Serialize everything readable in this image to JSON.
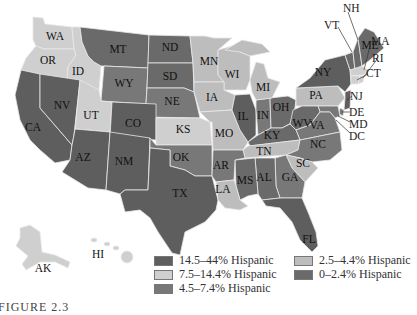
{
  "map": {
    "title": "Hispanic population by state",
    "categories": [
      {
        "id": "c1",
        "label": "14.5–44% Hispanic",
        "color": "#5e5e5e"
      },
      {
        "id": "c2",
        "label": "7.5–14.4% Hispanic",
        "color": "#cfcfcf"
      },
      {
        "id": "c3",
        "label": "4.5–7.4% Hispanic",
        "color": "#787878"
      },
      {
        "id": "c4",
        "label": "2.5–4.4% Hispanic",
        "color": "#bdbdbd"
      },
      {
        "id": "c5",
        "label": "0–2.4% Hispanic",
        "color": "#6a6a6a"
      }
    ],
    "states": {
      "WA": "c2",
      "OR": "c2",
      "ID": "c2",
      "MT": "c5",
      "ND": "c5",
      "SD": "c5",
      "WY": "c3",
      "NE": "c3",
      "MN": "c4",
      "WI": "c4",
      "IA": "c4",
      "MI": "c4",
      "CA": "c1",
      "NV": "c1",
      "UT": "c2",
      "CO": "c1",
      "KS": "c2",
      "MO": "c4",
      "IL": "c1",
      "IN": "c3",
      "OH": "c5",
      "PA": "c4",
      "NY": "c1",
      "ME": "c5",
      "NH": "c5",
      "VT": "c5",
      "MA": "c2",
      "RI": "c2",
      "CT": "c2",
      "NJ": "c1",
      "DE": "c3",
      "MD": "c3",
      "DC": "c2",
      "AZ": "c1",
      "NM": "c1",
      "TX": "c1",
      "OK": "c3",
      "AR": "c3",
      "LA": "c4",
      "KY": "c5",
      "WV": "c5",
      "VA": "c3",
      "TN": "c4",
      "NC": "c3",
      "SC": "c4",
      "MS": "c5",
      "AL": "c5",
      "GA": "c3",
      "FL": "c1",
      "AK": "c2",
      "HI": "c2"
    },
    "labels": [
      "WA",
      "OR",
      "ID",
      "MT",
      "ND",
      "SD",
      "WY",
      "NE",
      "MN",
      "WI",
      "IA",
      "MI",
      "CA",
      "NV",
      "UT",
      "CO",
      "KS",
      "MO",
      "IL",
      "IN",
      "OH",
      "PA",
      "NY",
      "ME",
      "AZ",
      "NM",
      "TX",
      "OK",
      "AR",
      "LA",
      "KY",
      "WV",
      "VA",
      "TN",
      "NC",
      "SC",
      "MS",
      "AL",
      "GA",
      "FL",
      "AK",
      "HI"
    ],
    "callout_labels": [
      "NH",
      "VT",
      "MA",
      "RI",
      "CT",
      "NJ",
      "DE",
      "MD",
      "DC"
    ]
  },
  "legend": {
    "items": [
      {
        "label": "14.5–44% Hispanic"
      },
      {
        "label": "7.5–14.4% Hispanic"
      },
      {
        "label": "4.5–7.4% Hispanic"
      },
      {
        "label": "2.5–4.4% Hispanic"
      },
      {
        "label": "0–2.4% Hispanic"
      }
    ]
  },
  "caption": "FIGURE 2.3"
}
